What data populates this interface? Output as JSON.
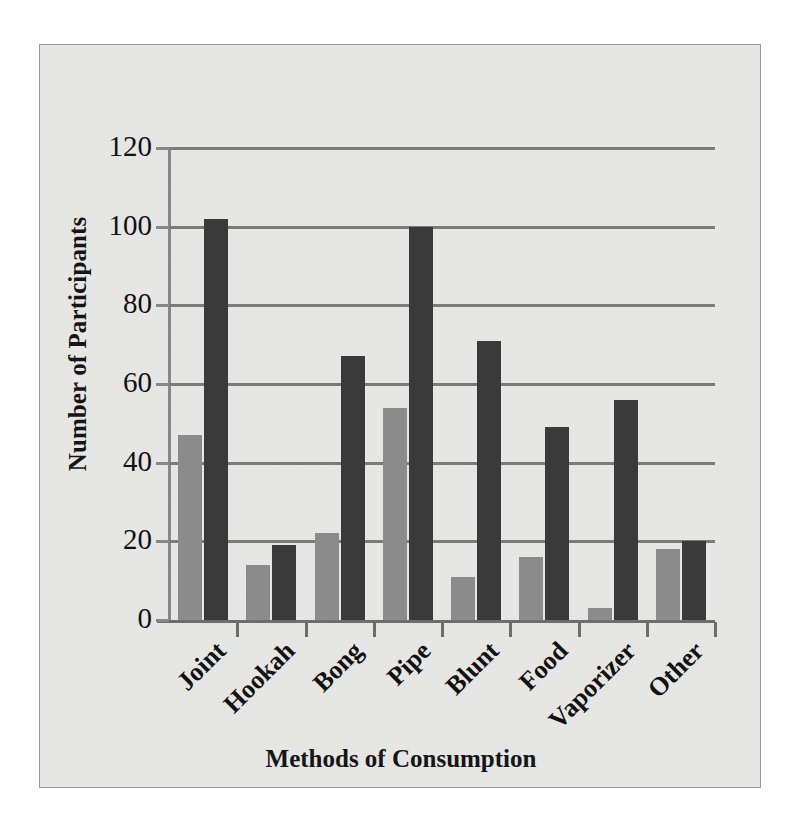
{
  "chart_data": {
    "type": "bar",
    "title": "",
    "xlabel": "Methods of Consumption",
    "ylabel": "Number of Participants",
    "categories": [
      "Joint",
      "Hookah",
      "Bong",
      "Pipe",
      "Blunt",
      "Food",
      "Vaporizer",
      "Other"
    ],
    "series": [
      {
        "name": "Series 1",
        "color": "#8d8d8d",
        "values": [
          47,
          14,
          22,
          54,
          11,
          16,
          3,
          18
        ]
      },
      {
        "name": "Series 2",
        "color": "#3b3b3b",
        "values": [
          102,
          19,
          67,
          100,
          71,
          49,
          56,
          20
        ]
      }
    ],
    "ylim": [
      0,
      120
    ],
    "yticks": [
      0,
      20,
      40,
      60,
      80,
      100,
      120
    ],
    "ytick_labels": [
      "0",
      "20",
      "40",
      "60",
      "80",
      "100",
      "120"
    ],
    "grid": "horizontal",
    "legend": "none",
    "xtick_label_rotation": -45
  },
  "axes": {
    "y_title": "Number of Participants",
    "x_title": "Methods of Consumption"
  },
  "style": {
    "background": "#e9e9e7",
    "border": "#9a9a9a",
    "gridline": "#7d7d7d",
    "axis": "#6f6f6f",
    "text": "#121212"
  }
}
